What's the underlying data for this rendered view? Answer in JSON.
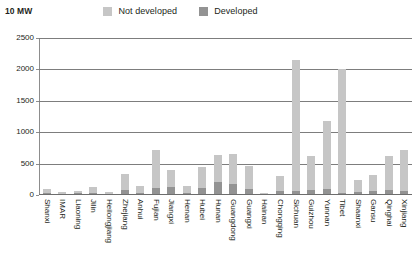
{
  "legend": {
    "unit_label": "10 MW",
    "entries": [
      {
        "label": "Not developed",
        "color": "#c6c6c6",
        "icon": "legend-swatch-icon"
      },
      {
        "label": "Developed",
        "color": "#939393",
        "icon": "legend-swatch-icon"
      }
    ]
  },
  "chart_data": {
    "type": "bar",
    "title": "",
    "subtitle": "",
    "xlabel": "",
    "ylabel": "10 MW",
    "ylim": [
      0,
      2500
    ],
    "ytick_labels": [
      "0",
      "500",
      "1000",
      "1500",
      "2000",
      "2500"
    ],
    "yticks": [
      0,
      500,
      1000,
      1500,
      2000,
      2500
    ],
    "grid": true,
    "stacked": true,
    "legend_position": "top",
    "categories": [
      "Shanxi",
      "IMAR",
      "Liaoning",
      "Jilin",
      "Heilongjiang",
      "Zhejiang",
      "Anhui",
      "Fujian",
      "Jiangxi",
      "Henan",
      "Hubei",
      "Hunan",
      "Guangdong",
      "Guangxi",
      "Hainan",
      "Chongqing",
      "Sichuan",
      "Guizhou",
      "Yunnan",
      "Tibet",
      "Shaanxi",
      "Gansu",
      "Qinghai",
      "Xinjiang"
    ],
    "series": [
      {
        "name": "Not developed",
        "color": "#c6c6c6",
        "values": [
          60,
          30,
          35,
          90,
          30,
          250,
          100,
          600,
          280,
          110,
          330,
          430,
          480,
          370,
          25,
          250,
          2080,
          540,
          1090,
          1975,
          195,
          255,
          540,
          650
        ]
      },
      {
        "name": "Developed",
        "color": "#939393",
        "values": [
          30,
          20,
          25,
          30,
          20,
          80,
          40,
          110,
          120,
          30,
          110,
          210,
          180,
          90,
          15,
          60,
          70,
          80,
          90,
          25,
          45,
          65,
          80,
          70
        ]
      }
    ],
    "totals": [
      90,
      50,
      60,
      120,
      50,
      330,
      140,
      710,
      400,
      140,
      440,
      640,
      660,
      460,
      40,
      310,
      2150,
      620,
      1180,
      2000,
      240,
      320,
      620,
      720
    ]
  }
}
